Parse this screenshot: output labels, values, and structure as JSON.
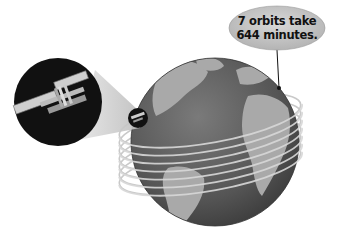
{
  "diagram": {
    "callout": {
      "line1": "7 orbits take",
      "line2": "644 minutes."
    },
    "elements": {
      "globe": "earth-globe",
      "orbits_count": 7,
      "magnifier": "space-station-magnified-view",
      "small_marker": "space-station-on-orbit"
    },
    "colors": {
      "ocean": "#5a5a5a",
      "land": "#a8a8a8",
      "orbit": "#d0d0d0",
      "magnifier_bg": "#111111",
      "callout_fill": "#c8c8c8"
    }
  }
}
